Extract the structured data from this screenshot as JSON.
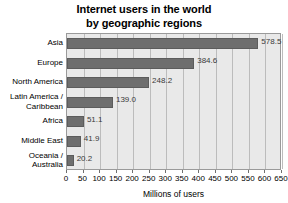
{
  "chart_data": {
    "type": "bar",
    "orientation": "horizontal",
    "title": "Internet users in the world by geographic regions",
    "title_lines": [
      "Internet users in the world",
      "by geographic regions"
    ],
    "categories": [
      "Asia",
      "Europe",
      "North America",
      "Latin America /\nCaribbean",
      "Africa",
      "Middle East",
      "Oceania /\nAustralia"
    ],
    "values": [
      578.5,
      384.6,
      248.2,
      139.0,
      51.1,
      41.9,
      20.2
    ],
    "value_labels": [
      "578.5",
      "384.6",
      "248.2",
      "139.0",
      "51.1",
      "41.9",
      "20.2"
    ],
    "xlabel": "Millions of users",
    "ylabel": "",
    "xlim": [
      0,
      650
    ],
    "xticks": [
      0,
      50,
      100,
      150,
      200,
      250,
      300,
      350,
      400,
      450,
      500,
      550,
      600,
      650
    ],
    "xticklabels": [
      "0",
      "50",
      "100",
      "150",
      "200",
      "250",
      "300",
      "350",
      "400",
      "450",
      "500",
      "550",
      "600",
      "650"
    ],
    "grid": true,
    "grid_axis": "x",
    "legend": false,
    "colors": {
      "bar": "#6e6e6e",
      "bar_edge": "#5c5c5c",
      "plot_background": "#e9e9e9",
      "gridline": "#bcbcbc",
      "frame": "#9a9a9a",
      "page_background": "#ffffff",
      "text": "#000000",
      "value_label": "#3a3a3a"
    }
  }
}
